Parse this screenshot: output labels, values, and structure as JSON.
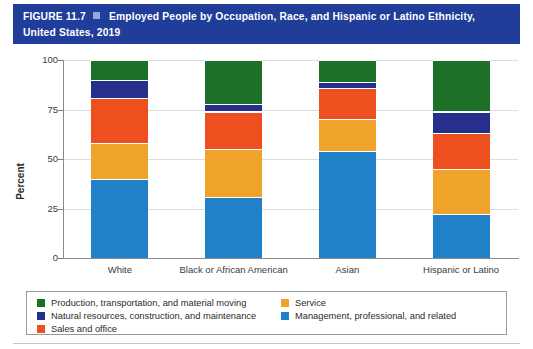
{
  "figure": {
    "number": "FIGURE 11.7",
    "bullet_icon": "square-bullet-icon",
    "title": "Employed People by Occupation, Race, and Hispanic or Latino Ethnicity, United States, 2019",
    "banner_color": "#1f3d99"
  },
  "chart_data": {
    "type": "bar",
    "stacked": true,
    "title": "Employed People by Occupation, Race, and Hispanic or Latino Ethnicity, United States, 2019",
    "xlabel": "",
    "ylabel": "Percent",
    "ylim": [
      0,
      100
    ],
    "yticks": [
      0,
      25,
      50,
      75,
      100
    ],
    "ytick_labels": [
      "0",
      "25",
      "50",
      "75",
      "100"
    ],
    "grid": true,
    "legend_position": "bottom",
    "categories": [
      "White",
      "Black or African American",
      "Asian",
      "Hispanic or Latino"
    ],
    "series": [
      {
        "name": "Management, professional, and related",
        "color": "#2080c8",
        "values": [
          40,
          31,
          54,
          22
        ]
      },
      {
        "name": "Service",
        "color": "#f0a32a",
        "values": [
          18,
          24,
          16,
          23
        ]
      },
      {
        "name": "Sales and office",
        "color": "#ee4f1e",
        "values": [
          23,
          19,
          16,
          18
        ]
      },
      {
        "name": "Natural resources, construction, and maintenance",
        "color": "#24308c",
        "values": [
          9,
          4,
          3,
          11
        ]
      },
      {
        "name": "Production, transportation, and material moving",
        "color": "#1d7027",
        "values": [
          10,
          22,
          11,
          26
        ]
      }
    ]
  },
  "legend": {
    "entries": [
      {
        "label": "Production, transportation, and material moving",
        "color": "#1d7027"
      },
      {
        "label": "Service",
        "color": "#f0a32a"
      },
      {
        "label": "Natural resources, construction, and maintenance",
        "color": "#24308c"
      },
      {
        "label": "Management, professional, and related",
        "color": "#2080c8"
      },
      {
        "label": "Sales and office",
        "color": "#ee4f1e"
      }
    ]
  }
}
